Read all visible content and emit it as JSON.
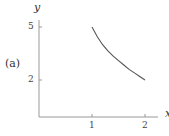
{
  "panel_label": "(a)",
  "chart_data": {
    "type": "line",
    "title": "",
    "xlabel": "x",
    "ylabel": "y",
    "x_ticks": [
      "1",
      "2"
    ],
    "y_ticks": [
      "2",
      "5"
    ],
    "series": [
      {
        "name": "curve",
        "x": [
          1.0,
          1.1,
          1.2,
          1.3,
          1.4,
          1.5,
          1.6,
          1.7,
          1.8,
          1.9,
          2.0
        ],
        "values": [
          5.0,
          4.45,
          4.0,
          3.65,
          3.35,
          3.1,
          2.85,
          2.6,
          2.4,
          2.2,
          2.0
        ]
      }
    ],
    "xlim": [
      0,
      2.3
    ],
    "ylim": [
      0,
      5.5
    ],
    "grid": false
  }
}
